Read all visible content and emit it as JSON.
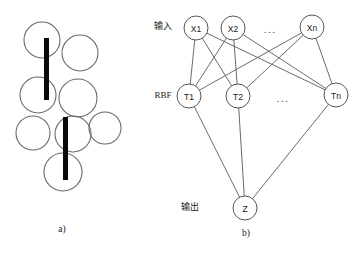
{
  "figure": {
    "width": 363,
    "height": 253,
    "background": "#ffffff",
    "stroke_color": "#5a5a5a",
    "bar_color": "#0a0a0a",
    "text_color": "#1a1a1a"
  },
  "panel_a": {
    "caption": "a)",
    "caption_x": 62,
    "caption_y": 229,
    "description": "overlapping receptive-field circles with two vertical black bars",
    "circles": [
      {
        "name": "blob-circle-1",
        "cx": 42,
        "cy": 40,
        "r": 18
      },
      {
        "name": "blob-circle-2",
        "cx": 80,
        "cy": 53,
        "r": 18
      },
      {
        "name": "blob-circle-3",
        "cx": 38,
        "cy": 95,
        "r": 18
      },
      {
        "name": "blob-circle-4",
        "cx": 78,
        "cy": 98,
        "r": 19
      },
      {
        "name": "blob-circle-5",
        "cx": 105,
        "cy": 128,
        "r": 16
      },
      {
        "name": "blob-circle-6",
        "cx": 33,
        "cy": 133,
        "r": 17
      },
      {
        "name": "blob-circle-7",
        "cx": 73,
        "cy": 134,
        "r": 18
      },
      {
        "name": "blob-circle-8",
        "cx": 63,
        "cy": 172,
        "r": 19
      }
    ],
    "bars": [
      {
        "name": "feature-bar-upper",
        "x": 44,
        "y": 38,
        "width": 5,
        "height": 62
      },
      {
        "name": "feature-bar-lower",
        "x": 63,
        "y": 117,
        "width": 5,
        "height": 63
      }
    ]
  },
  "panel_b": {
    "caption": "b)",
    "caption_x": 246,
    "caption_y": 233,
    "layer_labels": [
      {
        "name": "input-layer-label",
        "text": "输入",
        "x": 163,
        "y": 26
      },
      {
        "name": "rbf-layer-label",
        "text": "RBF",
        "x": 163,
        "y": 95
      },
      {
        "name": "output-layer-label",
        "text": "输出",
        "x": 190,
        "y": 207
      }
    ],
    "ellipses": [
      {
        "name": "input-ellipsis",
        "text": "...",
        "x": 270,
        "y": 29
      },
      {
        "name": "rbf-ellipsis",
        "text": "...",
        "x": 283,
        "y": 98
      }
    ],
    "input_nodes": [
      {
        "name": "node-x1",
        "label": "X1",
        "cx": 196,
        "cy": 28,
        "r": 12
      },
      {
        "name": "node-x2",
        "label": "X2",
        "cx": 233,
        "cy": 28,
        "r": 12
      },
      {
        "name": "node-xn",
        "label": "Xn",
        "cx": 312,
        "cy": 27,
        "r": 12
      }
    ],
    "rbf_nodes": [
      {
        "name": "node-t1",
        "label": "T1",
        "cx": 189,
        "cy": 96,
        "r": 12
      },
      {
        "name": "node-t2",
        "label": "T2",
        "cx": 238,
        "cy": 96,
        "r": 12
      },
      {
        "name": "node-tn",
        "label": "Tn",
        "cx": 336,
        "cy": 95,
        "r": 12
      }
    ],
    "output_node": {
      "name": "node-z",
      "label": "Z",
      "cx": 245,
      "cy": 208,
      "r": 12
    },
    "input_to_rbf_edges": [
      {
        "from": "node-x1",
        "to": "node-t1"
      },
      {
        "from": "node-x1",
        "to": "node-t2"
      },
      {
        "from": "node-x1",
        "to": "node-tn"
      },
      {
        "from": "node-x2",
        "to": "node-t1"
      },
      {
        "from": "node-x2",
        "to": "node-t2"
      },
      {
        "from": "node-x2",
        "to": "node-tn"
      },
      {
        "from": "node-xn",
        "to": "node-t1"
      },
      {
        "from": "node-xn",
        "to": "node-t2"
      },
      {
        "from": "node-xn",
        "to": "node-tn"
      }
    ],
    "rbf_to_output_edges": [
      {
        "from": "node-t1",
        "to": "node-z"
      },
      {
        "from": "node-t2",
        "to": "node-z"
      },
      {
        "from": "node-tn",
        "to": "node-z"
      }
    ]
  }
}
